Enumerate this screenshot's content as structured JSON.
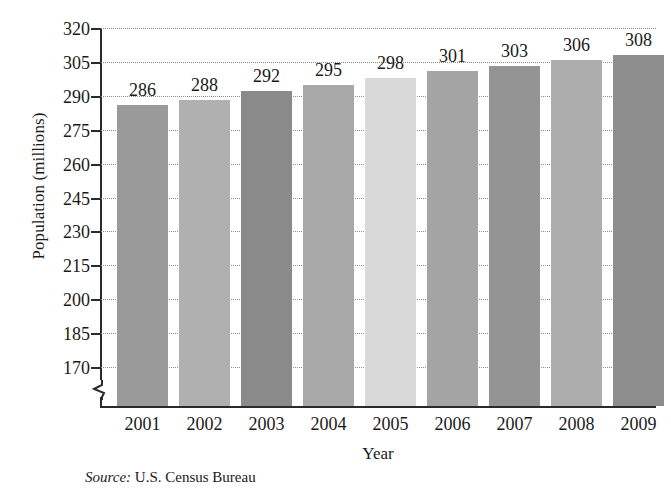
{
  "chart_data": {
    "type": "bar",
    "title": "",
    "xlabel": "Year",
    "ylabel": "Population (millions)",
    "categories": [
      "2001",
      "2002",
      "2003",
      "2004",
      "2005",
      "2006",
      "2007",
      "2008",
      "2009"
    ],
    "values": [
      286,
      288,
      292,
      295,
      298,
      301,
      303,
      306,
      308
    ],
    "value_labels": [
      "286",
      "288",
      "292",
      "295",
      "298",
      "301",
      "303",
      "306",
      "308"
    ],
    "bar_colors": [
      "#9a9a9a",
      "#b0b0b0",
      "#8a8a8a",
      "#a8a8a8",
      "#d9d9d9",
      "#a4a4a4",
      "#949494",
      "#adadad",
      "#8d8d8d"
    ],
    "ylim": [
      170,
      320
    ],
    "ytick_values": [
      320,
      305,
      290,
      275,
      260,
      245,
      230,
      215,
      200,
      185,
      170
    ],
    "ytick_labels": [
      "320",
      "305",
      "290",
      "275",
      "260",
      "245",
      "230",
      "215",
      "200",
      "185",
      "170"
    ],
    "ystep": 15,
    "axis_break": true,
    "grid": "horizontal-dotted",
    "legend": "none",
    "axis_color": "#2a2a2a",
    "grid_color": "#8d8d8d"
  },
  "source": {
    "label": "Source:",
    "text": "U.S. Census Bureau"
  }
}
